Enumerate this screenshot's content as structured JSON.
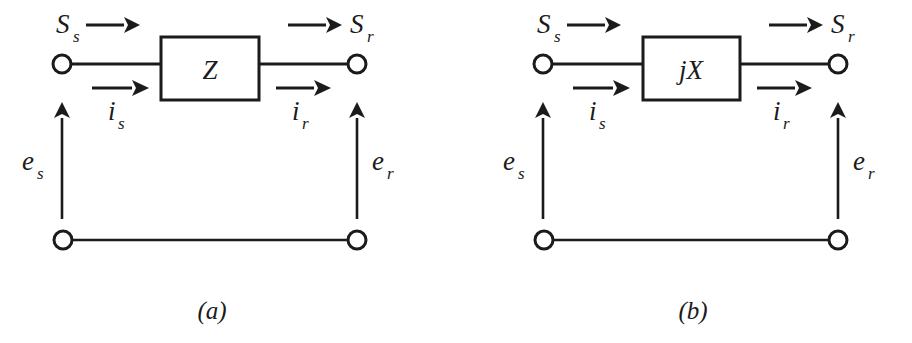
{
  "figure": {
    "type": "circuit-diagram",
    "background_color": "#ffffff",
    "ink_color": "#1b1b1b",
    "panels": [
      {
        "id": "a",
        "caption": "(a)",
        "component_label": "Z",
        "component_name": "series-impedance",
        "labels": {
          "sending_power": "S",
          "sending_power_sub": "s",
          "receiving_power": "S",
          "receiving_power_sub": "r",
          "sending_current": "i",
          "sending_current_sub": "s",
          "receiving_current": "i",
          "receiving_current_sub": "r",
          "sending_voltage": "e",
          "sending_voltage_sub": "s",
          "receiving_voltage": "e",
          "receiving_voltage_sub": "r"
        }
      },
      {
        "id": "b",
        "caption": "(b)",
        "component_label": "jX",
        "component_name": "series-reactance",
        "labels": {
          "sending_power": "S",
          "sending_power_sub": "s",
          "receiving_power": "S",
          "receiving_power_sub": "r",
          "sending_current": "i",
          "sending_current_sub": "s",
          "receiving_current": "i",
          "receiving_current_sub": "r",
          "sending_voltage": "e",
          "sending_voltage_sub": "s",
          "receiving_voltage": "e",
          "receiving_voltage_sub": "r"
        }
      }
    ]
  }
}
